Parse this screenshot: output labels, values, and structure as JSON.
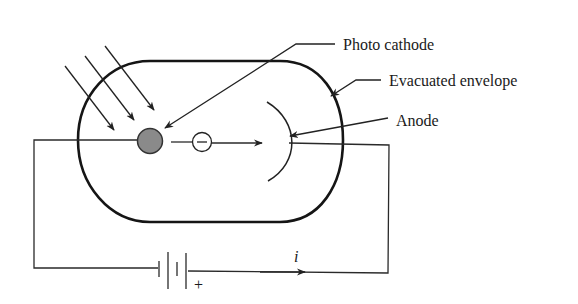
{
  "diagram": {
    "labels": {
      "photo_cathode": "Photo cathode",
      "evacuated_envelope": "Evacuated envelope",
      "anode": "Anode",
      "current": "i",
      "battery_positive": "+",
      "electron": "−"
    },
    "colors": {
      "line": "#222222",
      "cathode_fill": "#8a8a8a",
      "background": "#ffffff"
    },
    "incident_light_rays": 3
  }
}
